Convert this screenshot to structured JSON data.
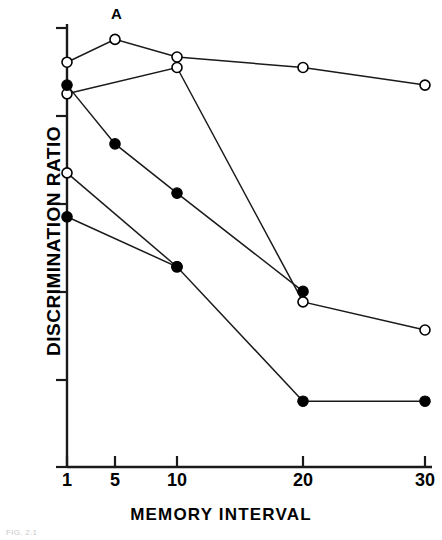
{
  "figure": {
    "panel_label": "A",
    "caption": "FIG. 2.1",
    "axis_color": "#1a1a1a"
  },
  "chart_data": {
    "type": "line",
    "title": "A",
    "xlabel": "MEMORY INTERVAL",
    "ylabel": "DISCRIMINATION RATIO",
    "grid": false,
    "legend": "none",
    "x_tick_labels": [
      "1",
      "5",
      "10",
      "20",
      "30"
    ],
    "x_tick_values": [
      1,
      5,
      10,
      20,
      30
    ],
    "y_tick_labels": [
      "1·0",
      "·9",
      "·8",
      "·7",
      "·6",
      "·5"
    ],
    "y_tick_values": [
      1.0,
      0.9,
      0.8,
      0.7,
      0.6,
      0.5
    ],
    "ylim": [
      0.5,
      1.0
    ],
    "series": [
      {
        "name": "open-series-1",
        "marker": "open-circle",
        "x": [
          1,
          5,
          10,
          20,
          30
        ],
        "values": [
          0.961,
          0.987,
          0.967,
          0.955,
          0.935
        ]
      },
      {
        "name": "open-series-2",
        "marker": "open-circle",
        "x": [
          1,
          10,
          20,
          30
        ],
        "values": [
          0.925,
          0.955,
          0.688,
          0.656
        ]
      },
      {
        "name": "filled-series-1",
        "marker": "filled-circle",
        "x": [
          1,
          5,
          10,
          20
        ],
        "values": [
          0.935,
          0.868,
          0.812,
          0.7
        ]
      },
      {
        "name": "open-series-3",
        "marker": "open-circle",
        "x": [
          1,
          10
        ],
        "values": [
          0.835,
          0.728
        ]
      },
      {
        "name": "filled-series-2",
        "marker": "filled-circle",
        "x": [
          1,
          10,
          20,
          30
        ],
        "values": [
          0.785,
          0.728,
          0.575,
          0.575
        ]
      }
    ]
  }
}
